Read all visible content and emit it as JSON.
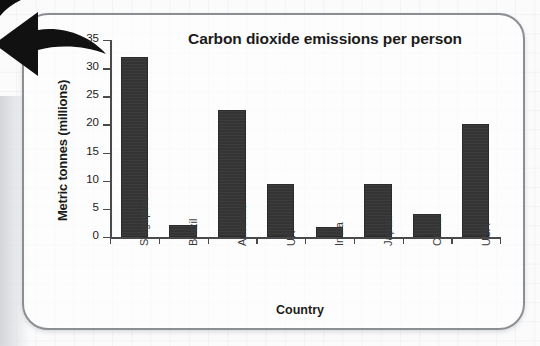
{
  "chart_data": {
    "type": "bar",
    "title": "Carbon dioxide emissions per person",
    "xlabel": "Country",
    "ylabel": "Metric tonnes (millions)",
    "categories": [
      "Singapore",
      "Brazil",
      "Australia",
      "UK",
      "India",
      "Japan",
      "China",
      "USA"
    ],
    "values": [
      32,
      2.1,
      22.5,
      9.5,
      1.7,
      9.5,
      4,
      20
    ],
    "ylim": [
      0,
      35
    ],
    "ytick_labels": [
      "0",
      "5",
      "10",
      "15",
      "20",
      "25",
      "30",
      "35"
    ],
    "ytick_values": [
      0,
      5,
      10,
      15,
      20,
      25,
      30,
      35
    ],
    "grid": false,
    "legend": "none",
    "bar_color": "#343434",
    "axis_color": "#4a4a4a"
  },
  "decor": {
    "arrow_icon": "left-arrow-icon",
    "arrow_color": "#111111",
    "card_border_color": "#8b8f94"
  }
}
